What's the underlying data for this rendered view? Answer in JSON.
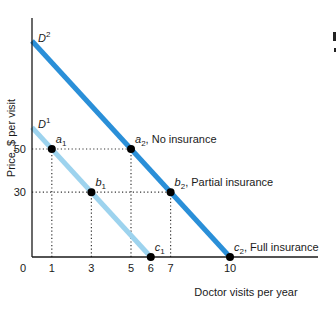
{
  "chart_data": {
    "type": "line",
    "title": "",
    "xlabel": "Doctor visits per year",
    "ylabel": "Price, $ per visit",
    "xlim": [
      0,
      14
    ],
    "ylim": [
      0,
      102
    ],
    "x_ticks": [
      "0",
      "1",
      "3",
      "5",
      "6",
      "7",
      "10"
    ],
    "y_ticks": [
      "50",
      "30"
    ],
    "grid": false,
    "legend": null,
    "colors": {
      "D1": "#9dd3ee",
      "D2": "#2a8fd8",
      "axis": "#1a1a1a",
      "points": "#000000"
    },
    "series": [
      {
        "name": "D1",
        "label": "D",
        "label_sup": "1",
        "x": [
          0,
          1,
          3,
          6
        ],
        "y": [
          60,
          50,
          30,
          0
        ]
      },
      {
        "name": "D2",
        "label": "D",
        "label_sup": "2",
        "x": [
          0,
          5,
          7,
          10
        ],
        "y": [
          100,
          50,
          30,
          0
        ]
      }
    ],
    "points": [
      {
        "id": "a1",
        "base": "a",
        "sub": "1",
        "x": 1,
        "y": 50,
        "note": ""
      },
      {
        "id": "b1",
        "base": "b",
        "sub": "1",
        "x": 3,
        "y": 30,
        "note": ""
      },
      {
        "id": "c1",
        "base": "c",
        "sub": "1",
        "x": 6,
        "y": 0,
        "note": ""
      },
      {
        "id": "a2",
        "base": "a",
        "sub": "2",
        "x": 5,
        "y": 50,
        "note": ", No insurance"
      },
      {
        "id": "b2",
        "base": "b",
        "sub": "2",
        "x": 7,
        "y": 30,
        "note": ", Partial insurance"
      },
      {
        "id": "c2",
        "base": "c",
        "sub": "2",
        "x": 10,
        "y": 0,
        "note": ", Full insurance"
      }
    ],
    "annotations": [
      "a2, No insurance",
      "b2, Partial insurance",
      "c2, Full insurance"
    ],
    "guides": [
      {
        "type": "horizontal",
        "y": 50,
        "from_x": 0,
        "to_x": 5
      },
      {
        "type": "horizontal",
        "y": 30,
        "from_x": 0,
        "to_x": 7
      },
      {
        "type": "vertical",
        "x": 1,
        "from_y": 0,
        "to_y": 50
      },
      {
        "type": "vertical",
        "x": 3,
        "from_y": 0,
        "to_y": 30
      },
      {
        "type": "vertical",
        "x": 5,
        "from_y": 0,
        "to_y": 50
      },
      {
        "type": "vertical",
        "x": 7,
        "from_y": 0,
        "to_y": 30
      }
    ]
  }
}
